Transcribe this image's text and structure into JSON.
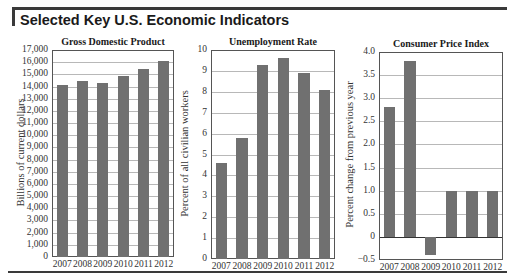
{
  "header": {
    "title": "Selected Key U.S. Economic Indicators"
  },
  "chart_data": [
    {
      "type": "bar",
      "title": "Gross Domestic Product",
      "xlabel": "",
      "ylabel": "Billions of current dollars",
      "categories": [
        "2007",
        "2008",
        "2009",
        "2010",
        "2011",
        "2012"
      ],
      "values": [
        14100,
        14450,
        14250,
        14900,
        15450,
        16100
      ],
      "ylim": [
        0,
        17000
      ],
      "yticks": [
        "0",
        "1,000",
        "2,000",
        "3,000",
        "4,000",
        "5,000",
        "6,000",
        "7,000",
        "8,000",
        "9,000",
        "10,000",
        "11,000",
        "12,000",
        "13,000",
        "14,000",
        "15,000",
        "16,000",
        "17,000"
      ],
      "grid": true,
      "legend": null
    },
    {
      "type": "bar",
      "title": "Unemployment Rate",
      "xlabel": "",
      "ylabel": "Percent of all civilian workers",
      "categories": [
        "2007",
        "2008",
        "2009",
        "2010",
        "2011",
        "2012"
      ],
      "values": [
        4.6,
        5.8,
        9.3,
        9.6,
        8.9,
        8.1
      ],
      "ylim": [
        0,
        10
      ],
      "yticks": [
        "0",
        "1",
        "2",
        "3",
        "4",
        "5",
        "6",
        "7",
        "8",
        "9",
        "10"
      ],
      "grid": true,
      "legend": null
    },
    {
      "type": "bar",
      "title": "Consumer Price Index",
      "xlabel": "",
      "ylabel": "Percent change from previous year",
      "categories": [
        "2007",
        "2008",
        "2009",
        "2010",
        "2011",
        "2012"
      ],
      "values": [
        2.8,
        3.8,
        -0.4,
        1.0,
        1.0,
        1.0
      ],
      "ylim": [
        -0.5,
        4.0
      ],
      "yticks": [
        "−0.5",
        "0",
        "0.5",
        "1.0",
        "1.5",
        "2.0",
        "2.5",
        "3.0",
        "3.5",
        "4.0"
      ],
      "grid": true,
      "legend": null
    }
  ],
  "colors": {
    "bar": "#707070",
    "grid": "#b8b8b8",
    "rule": "#3a3a3a"
  }
}
